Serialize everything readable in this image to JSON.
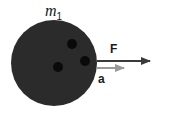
{
  "diagram": {
    "mass_label": {
      "symbol": "m",
      "subscript": "1"
    },
    "force_label": "F",
    "acceleration_label": "a",
    "ball": {
      "color": "#2b2b2b",
      "hole_color": "#0a0a0a",
      "holes": 3
    },
    "force_arrow": {
      "color": "#3a3a3a",
      "direction": "right"
    },
    "acceleration_arrow": {
      "color": "#9a9a9a",
      "direction": "right"
    }
  }
}
